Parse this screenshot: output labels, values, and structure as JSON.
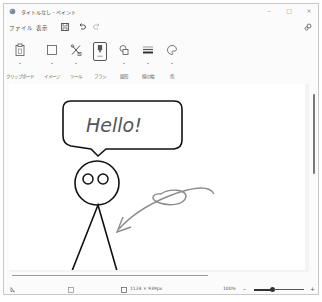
{
  "window": {
    "title": "タイトルなし - ペイント",
    "controls": {
      "minimize": "–",
      "maximize": "□",
      "close": "×"
    }
  },
  "menubar": {
    "items": [
      {
        "label": "ファイル"
      },
      {
        "label": "表示"
      }
    ],
    "quick_access": [
      "save-icon",
      "undo-icon",
      "redo-icon"
    ],
    "settings_icon": "gear-icon"
  },
  "ribbon": {
    "groups": [
      {
        "label": "クリップボード",
        "icon": "clipboard-icon",
        "selected": false
      },
      {
        "label": "イメージ",
        "icon": "selection-icon",
        "selected": false
      },
      {
        "label": "ツール",
        "icon": "tools-icon",
        "selected": false
      },
      {
        "label": "ブラシ",
        "icon": "brush-icon",
        "selected": true
      },
      {
        "label": "図形",
        "icon": "shapes-icon",
        "selected": false
      },
      {
        "label": "線の幅",
        "icon": "line-width-icon",
        "selected": false
      },
      {
        "label": "色",
        "icon": "palette-icon",
        "selected": false
      }
    ]
  },
  "canvas": {
    "speech_bubble_text": "Hello!",
    "colors": {
      "ink": "#111111",
      "pencil": "#8c8c8c",
      "background": "#ffffff"
    }
  },
  "statusbar": {
    "cursor_icon": "pointer-position-icon",
    "selection_icon": "selection-size-icon",
    "canvas_size": "1124 × 939px",
    "zoom_level": "100%",
    "zoom_out": "–",
    "zoom_in": "+"
  }
}
